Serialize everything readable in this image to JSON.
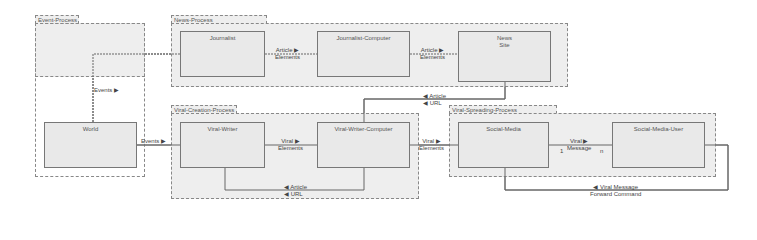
{
  "packages": {
    "event": "Event-Process",
    "news": "News-Process",
    "viral_creation": "Viral-Creation-Process",
    "viral_spreading": "Viral-Spreading-Process"
  },
  "nodes": {
    "world": "World",
    "journalist": "Journalist",
    "journalist_computer": "Journalist-Computer",
    "news_site_line1": "News",
    "news_site_line2": "Site",
    "viral_writer": "Viral-Writer",
    "viral_writer_computer": "Viral-Writer-Computer",
    "social_media": "Social-Media",
    "social_media_user": "Social-Media-User"
  },
  "edges": {
    "events_up": "Events ▶",
    "events_right": "Events ▶",
    "article_elements_1": [
      "Article ▶",
      "Elements"
    ],
    "article_elements_2": [
      "Article ▶",
      "Elements"
    ],
    "article_url_top": [
      "◀ Article",
      "◀ URL"
    ],
    "viral_elements_1": [
      "Viral ▶",
      "Elements"
    ],
    "viral_elements_2": [
      "Viral ▶",
      "Elements"
    ],
    "article_url_bottom": [
      "◀ Article",
      "◀ URL"
    ],
    "viral_message": [
      "Viral ▶",
      "Message"
    ],
    "viral_message_back": [
      "◀ Viral Message",
      "Forward Command"
    ],
    "multiplicity_left": "1",
    "multiplicity_right": "n"
  }
}
